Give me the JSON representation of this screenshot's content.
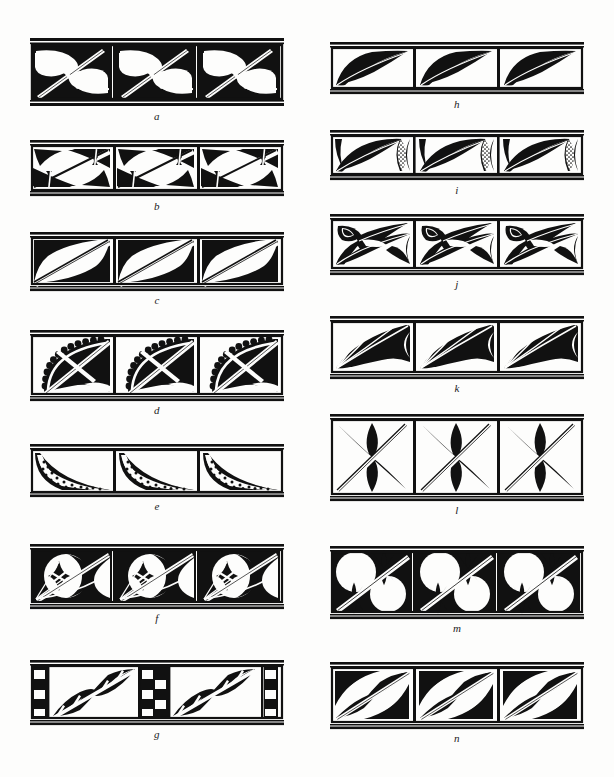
{
  "plate": {
    "title": "Decorative border band patterns plate",
    "description": "Black-and-white plate of fourteen repeating ornamental border bands labelled a through n, arranged in two columns of seven.",
    "background_color": "#fdfdfc",
    "ink_color": "#111111",
    "page_width": 614,
    "page_height": 777,
    "columns": 2,
    "figures_per_column": 7
  },
  "figures": [
    {
      "id": "a",
      "label": "a",
      "column": "left",
      "x": 30,
      "y": 38,
      "width": 254,
      "height": 70,
      "label_y": 110,
      "repeats": 3,
      "motif": "crescent-and-pinwheel-with-diagonal-spear",
      "fill": "solid-black",
      "notes": "Each cell holds two interlocking white comma/crescent forms on black, crossed by a long diagonal double-line spear with a small crossbar."
    },
    {
      "id": "b",
      "label": "b",
      "column": "left",
      "x": 30,
      "y": 140,
      "width": 254,
      "height": 58,
      "label_y": 200,
      "repeats": 3,
      "motif": "paired-opposed-spike-triangles-with-scalloped-toggle",
      "fill": "solid-black",
      "notes": "Diagonal split cell; opposed black spiked triangles above and below a white diagonal band, with small scalloped toggles at the corners."
    },
    {
      "id": "c",
      "label": "c",
      "column": "left",
      "x": 30,
      "y": 232,
      "width": 254,
      "height": 60,
      "label_y": 294,
      "repeats": 3,
      "motif": "opposed-concave-triangles-with-double-diagonal",
      "fill": "solid-black",
      "notes": "Two black concave-sided triangles (upper-left and lower-right) separated by a white double-ruled diagonal stripe."
    },
    {
      "id": "d",
      "label": "d",
      "column": "left",
      "x": 30,
      "y": 330,
      "width": 254,
      "height": 72,
      "label_y": 404,
      "repeats": 3,
      "motif": "scalloped-arc-quadrant-with-crossed-diagonals",
      "fill": "solid-black",
      "notes": "Black quadrant bounded by a scalloped (cusped) arc, crossed by a white diagonal X of double lines."
    },
    {
      "id": "e",
      "label": "e",
      "column": "left",
      "x": 30,
      "y": 444,
      "width": 254,
      "height": 54,
      "label_y": 506,
      "repeats": 3,
      "motif": "dotted-diagonal-band-over-black-triangle",
      "fill": "solid-black-with-stipple",
      "notes": "Lower-left black triangle edged by a white crescent band filled with a double row of black dots."
    },
    {
      "id": "f",
      "label": "f",
      "column": "left",
      "x": 30,
      "y": 544,
      "width": 254,
      "height": 66,
      "label_y": 614,
      "repeats": 3,
      "motif": "crescent-moon-with-four-point-star-and-diagonal",
      "fill": "solid-black",
      "notes": "Large white crescent/disc on black with a small concave four-pointed star at the left and a long double-line diagonal."
    },
    {
      "id": "g",
      "label": "g",
      "column": "left",
      "x": 30,
      "y": 660,
      "width": 254,
      "height": 66,
      "label_y": 730,
      "repeats": 2,
      "motif": "checkerboard-columns-with-double-lozenge-diagonal",
      "fill": "solid-black",
      "notes": "Vertical checkerboard bars alternate with panels containing an S-shaped pair of black lozenges bisected by a white diagonal line."
    },
    {
      "id": "h",
      "label": "h",
      "column": "right",
      "x": 330,
      "y": 42,
      "width": 254,
      "height": 54,
      "label_y": 98,
      "repeats": 3,
      "motif": "swept-leaf-blade-with-white-midrib",
      "fill": "solid-black",
      "notes": "Large black leaf/blade sweeping up to the right with a fine white midrib line; white lens shape at the right edge of each cell."
    },
    {
      "id": "i",
      "label": "i",
      "column": "right",
      "x": 330,
      "y": 130,
      "width": 254,
      "height": 52,
      "label_y": 184,
      "repeats": 3,
      "motif": "swept-blade-with-stippled-half-lens",
      "fill": "solid-black-with-stipple",
      "notes": "Same swept blade as h but the lens at the cell join is half black, half stippled with fine dots."
    },
    {
      "id": "j",
      "label": "j",
      "column": "right",
      "x": 330,
      "y": 214,
      "width": 254,
      "height": 62,
      "label_y": 278,
      "repeats": 3,
      "motif": "double-blade-spray-with-eye-lens",
      "fill": "solid-black",
      "notes": "Two crossing black blades per cell with a small pointed eye-lens (black with white slit) at the upper left."
    },
    {
      "id": "k",
      "label": "k",
      "column": "right",
      "x": 330,
      "y": 316,
      "width": 254,
      "height": 64,
      "label_y": 382,
      "repeats": 3,
      "motif": "palm-frond-spray-with-white-veins",
      "fill": "solid-black",
      "notes": "Fan of black pointed fronds radiating from the lower-left corner, separated by thin white vein lines."
    },
    {
      "id": "l",
      "label": "l",
      "column": "right",
      "x": 330,
      "y": 414,
      "width": 254,
      "height": 88,
      "label_y": 504,
      "repeats": 3,
      "motif": "four-pointed-concave-star-with-double-diagonal",
      "fill": "solid-black",
      "notes": "Concave four-pointed black star centred in each cell, traversed by a white double-ruled diagonal from corner to corner."
    },
    {
      "id": "m",
      "label": "m",
      "column": "right",
      "x": 330,
      "y": 546,
      "width": 254,
      "height": 74,
      "label_y": 622,
      "repeats": 3,
      "motif": "four-point-stars-between-white-discs-with-diagonal",
      "fill": "solid-black",
      "notes": "Black ground with two large white discs per cell; concave four-pointed stars fill the interstices and a white double diagonal cuts across."
    },
    {
      "id": "n",
      "label": "n",
      "column": "right",
      "x": 330,
      "y": 662,
      "width": 254,
      "height": 68,
      "label_y": 732,
      "repeats": 3,
      "motif": "mirrored-leaf-lobes-with-diagonal-spindle",
      "fill": "solid-black",
      "notes": "Mirrored black leaf lobes in opposite corners with an S-curved spindle of black bulges along the white diagonal."
    }
  ]
}
